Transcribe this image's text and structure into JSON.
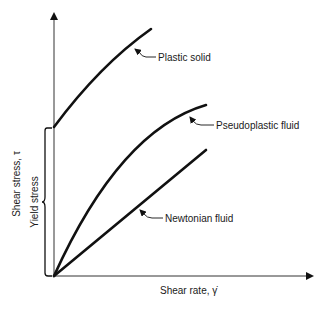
{
  "axes": {
    "x_label": "Shear rate, γ̇",
    "y_label": "Shear stress, τ"
  },
  "annotations": {
    "yield_stress": "Yield stress"
  },
  "curves": [
    {
      "name": "Plastic solid",
      "label": "Plastic solid"
    },
    {
      "name": "Pseudoplastic fluid",
      "label": "Pseudoplastic fluid"
    },
    {
      "name": "Newtonian fluid",
      "label": "Newtonian fluid"
    }
  ],
  "colors": {
    "ink": "#111111",
    "background": "#ffffff"
  }
}
